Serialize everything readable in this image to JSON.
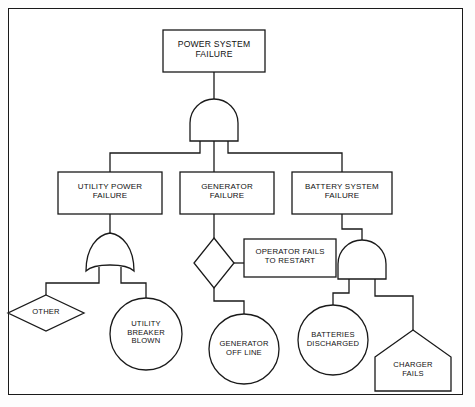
{
  "diagram": {
    "stroke_color": "#1a1a1a",
    "fill_color": "#ffffff",
    "text_color": "#111111",
    "frame": {
      "label": "diagram-border"
    }
  },
  "nodes": {
    "top_event": {
      "label": "POWER SYSTEM\nFAILURE",
      "shape": "rectangle",
      "font_size": 8.6
    },
    "gate_top": {
      "label": "",
      "shape": "and-gate",
      "inputs": 3
    },
    "utility_power_failure": {
      "label": "UTILITY POWER\nFAILURE",
      "shape": "rectangle",
      "font_size": 8.0
    },
    "generator_failure": {
      "label": "GENERATOR\nFAILURE",
      "shape": "rectangle",
      "font_size": 8.0
    },
    "battery_system_failure": {
      "label": "BATTERY SYSTEM\nFAILURE",
      "shape": "rectangle",
      "font_size": 8.0
    },
    "gate_utility_or": {
      "label": "",
      "shape": "or-gate",
      "inputs": 2
    },
    "transfer_generator": {
      "label": "",
      "shape": "diamond"
    },
    "operator_fails_to_restart": {
      "label": "OPERATOR FAILS\nTO RESTART",
      "shape": "rectangle",
      "font_size": 7.8
    },
    "gate_battery_and": {
      "label": "",
      "shape": "and-gate",
      "inputs": 2
    },
    "other": {
      "label": "OTHER",
      "shape": "diamond",
      "font_size": 7.6
    },
    "utility_breaker_blown": {
      "label": "UTILITY\nBREAKER\nBLOWN",
      "shape": "circle",
      "font_size": 7.6
    },
    "generator_off_line": {
      "label": "GENERATOR\nOFF LINE",
      "shape": "circle",
      "font_size": 7.6
    },
    "batteries_discharged": {
      "label": "BATTERIES\nDISCHARGED",
      "shape": "circle",
      "font_size": 7.6
    },
    "charger_fails": {
      "label": "CHARGER\nFAILS",
      "shape": "house",
      "font_size": 7.6
    }
  },
  "connections": [
    {
      "from": "top_event",
      "to": "gate_top"
    },
    {
      "from": "gate_top",
      "to": "utility_power_failure"
    },
    {
      "from": "gate_top",
      "to": "generator_failure"
    },
    {
      "from": "gate_top",
      "to": "battery_system_failure"
    },
    {
      "from": "utility_power_failure",
      "to": "gate_utility_or"
    },
    {
      "from": "gate_utility_or",
      "to": "other"
    },
    {
      "from": "gate_utility_or",
      "to": "utility_breaker_blown"
    },
    {
      "from": "generator_failure",
      "to": "transfer_generator"
    },
    {
      "from": "transfer_generator",
      "to": "operator_fails_to_restart"
    },
    {
      "from": "transfer_generator",
      "to": "generator_off_line"
    },
    {
      "from": "battery_system_failure",
      "to": "gate_battery_and"
    },
    {
      "from": "gate_battery_and",
      "to": "batteries_discharged"
    },
    {
      "from": "gate_battery_and",
      "to": "charger_fails"
    }
  ]
}
